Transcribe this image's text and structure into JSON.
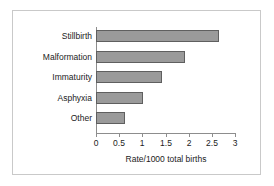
{
  "chart_data": {
    "type": "bar",
    "orientation": "horizontal",
    "title": "",
    "xlabel": "Rate/1000 total births",
    "ylabel": "",
    "categories": [
      "Stillbirth",
      "Malformation",
      "Immaturity",
      "Asphyxia",
      "Other"
    ],
    "values": [
      2.65,
      1.92,
      1.43,
      1.02,
      0.62
    ],
    "xlim": [
      0,
      3
    ],
    "xticks": [
      0,
      0.5,
      1,
      1.5,
      2,
      2.5,
      3
    ],
    "xtick_labels": [
      "0",
      "0.5",
      "1",
      "1.5",
      "2",
      "2.5",
      "3"
    ],
    "grid": false,
    "legend": null,
    "bar_fill_color": "#9a9a9a",
    "bar_border_color": "#5f5f5f",
    "axis_color": "#8d8d8d",
    "text_color": "#1b1b1b",
    "frame_color": "#c9c9c9",
    "background_color": "#ffffff"
  }
}
